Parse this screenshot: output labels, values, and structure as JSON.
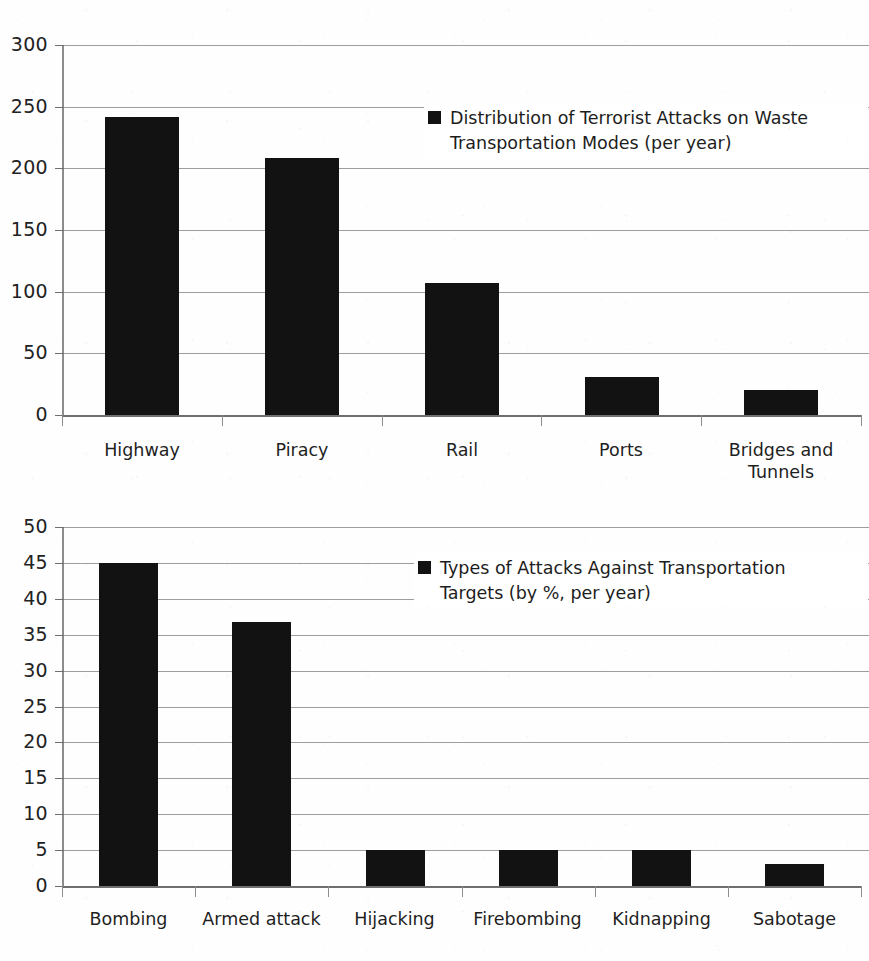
{
  "chart_data": [
    {
      "type": "bar",
      "title": "",
      "legend": [
        "Distribution of Terrorist Attacks on Waste Transportation Modes (per year)"
      ],
      "legend_position": "inside-top-right",
      "categories": [
        "Highway",
        "Piracy",
        "Rail",
        "Ports",
        "Bridges and Tunnels"
      ],
      "values": [
        242,
        208,
        107,
        31,
        20
      ],
      "xlabel": "",
      "ylabel": "",
      "ylim": [
        0,
        300
      ],
      "ytick_labels": [
        "300",
        "250",
        "200",
        "150",
        "100",
        "50",
        "0"
      ],
      "ytick_values": [
        300,
        250,
        200,
        150,
        100,
        50,
        0
      ],
      "grid": true,
      "bar_color": "#121212"
    },
    {
      "type": "bar",
      "title": "",
      "legend": [
        "Types of Attacks Against Transportation Targets (by %, per year)"
      ],
      "legend_position": "inside-top-right",
      "categories": [
        "Bombing",
        "Armed attack",
        "Hijacking",
        "Firebombing",
        "Kidnapping",
        "Sabotage"
      ],
      "values": [
        45,
        36.8,
        5,
        5,
        5,
        3
      ],
      "xlabel": "",
      "ylabel": "",
      "ylim": [
        0,
        50
      ],
      "ytick_labels": [
        "50",
        "45",
        "40",
        "35",
        "30",
        "25",
        "20",
        "15",
        "10",
        "5",
        "0"
      ],
      "ytick_values": [
        50,
        45,
        40,
        35,
        30,
        25,
        20,
        15,
        10,
        5,
        0
      ],
      "grid": true,
      "bar_color": "#121212"
    }
  ],
  "charts": [
    {
      "legend_label": "Distribution of Terrorist Attacks on Waste\nTransportation Modes (per year)"
    },
    {
      "legend_label": "Types of Attacks Against Transportation\nTargets (by %, per year)"
    }
  ],
  "colors": {
    "bar": "#121212",
    "gridline": "#8d8d8d",
    "text": "#1d1d1d",
    "background": "#fefefe"
  }
}
